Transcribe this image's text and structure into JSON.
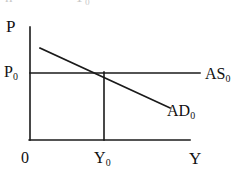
{
  "figure": {
    "type": "economics-ad-as-diagram",
    "background_color": "#ffffff",
    "line_color": "#1a1a1a",
    "text_color": "#111111",
    "clipped_top_text": {
      "fragment_left": "n",
      "fragment_right": "Y₀"
    },
    "axes": {
      "vertical_axis_label": "P",
      "horizontal_axis_label": "Y",
      "origin_label": "0"
    },
    "labels": {
      "price_level": "P",
      "equilibrium_price": "P",
      "equilibrium_price_sub": "0",
      "output": "Y",
      "equilibrium_output": "Y",
      "equilibrium_output_sub": "0",
      "origin": "0",
      "aggregate_supply": "AS",
      "aggregate_supply_sub": "0",
      "aggregate_demand": "AD",
      "aggregate_demand_sub": "0"
    },
    "curves": [
      {
        "name": "aggregate-supply",
        "label": "AS0",
        "shape": "horizontal",
        "description": "Perfectly elastic (horizontal) aggregate supply at price level P0",
        "points": [
          {
            "x": 30,
            "y": 73
          },
          {
            "x": 200,
            "y": 73
          }
        ]
      },
      {
        "name": "aggregate-demand",
        "label": "AD0",
        "shape": "downward-sloping-linear",
        "description": "Downward sloping aggregate demand curve",
        "points": [
          {
            "x": 40,
            "y": 48
          },
          {
            "x": 170,
            "y": 108
          }
        ]
      }
    ],
    "guides": [
      {
        "name": "equilibrium-dropline",
        "description": "Vertical dashed-free dropline from equilibrium point to Y0 on the horizontal axis",
        "points": [
          {
            "x": 104,
            "y": 73
          },
          {
            "x": 104,
            "y": 140
          }
        ]
      }
    ],
    "equilibrium_point": {
      "x": 104,
      "y": 73,
      "price": "P0",
      "output": "Y0"
    },
    "axis_geometry": {
      "vertical_axis": {
        "x": 30,
        "y_top": 27,
        "y_bottom": 140
      },
      "horizontal_axis": {
        "y": 140,
        "x_left": 30,
        "x_right": 190
      }
    }
  }
}
